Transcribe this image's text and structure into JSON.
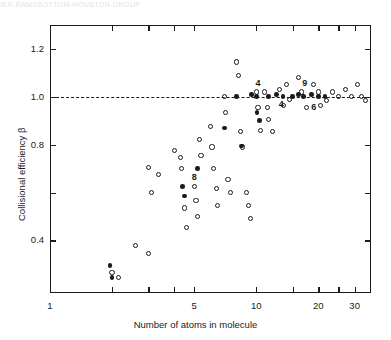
{
  "page_header": "IER-RAMSBOTTOM-HOUSTON-GROUP",
  "figure": {
    "ytitle": "Collisional efficiency β",
    "xtitle": "Number of atoms in molecule",
    "reference_line_value": 1.0
  },
  "chart_data": {
    "type": "scatter",
    "title": "",
    "xlabel": "Number of atoms in molecule",
    "ylabel": "Collisional efficiency β",
    "xscale": "log",
    "xlim": [
      1,
      36
    ],
    "ylim": [
      0.18,
      1.3
    ],
    "yticks": [
      0.4,
      0.6,
      0.8,
      1.0,
      1.2
    ],
    "ytick_labels": [
      "0.4",
      "",
      "0.8",
      "1.0",
      "1.2"
    ],
    "xticks": [
      1,
      2,
      3,
      4,
      5,
      10,
      15,
      20,
      25,
      30
    ],
    "xtick_labels": [
      "1",
      "",
      "",
      "",
      "5",
      "10",
      "",
      "20",
      "",
      "30"
    ],
    "grid": false,
    "legend": null,
    "reference_lines": [
      {
        "orientation": "horizontal",
        "value": 1.0,
        "style": "dashed"
      }
    ],
    "series": [
      {
        "name": "open circles",
        "marker": "open-circle",
        "points": [
          [
            2.0,
            0.265
          ],
          [
            2.15,
            0.245
          ],
          [
            2.6,
            0.38
          ],
          [
            3.0,
            0.345
          ],
          [
            3.1,
            0.6
          ],
          [
            3.0,
            0.705
          ],
          [
            3.35,
            0.675
          ],
          [
            4.0,
            0.775
          ],
          [
            4.3,
            0.745
          ],
          [
            4.35,
            0.7
          ],
          [
            4.5,
            0.535
          ],
          [
            4.6,
            0.455
          ],
          [
            5.0,
            0.625
          ],
          [
            5.1,
            0.565
          ],
          [
            5.2,
            0.5
          ],
          [
            5.3,
            0.82
          ],
          [
            5.4,
            0.755
          ],
          [
            6.0,
            0.875
          ],
          [
            6.1,
            0.79
          ],
          [
            6.2,
            0.7
          ],
          [
            6.4,
            0.615
          ],
          [
            6.5,
            0.545
          ],
          [
            7.0,
            1.0
          ],
          [
            7.1,
            0.935
          ],
          [
            7.3,
            0.655
          ],
          [
            7.5,
            0.6
          ],
          [
            8.0,
            1.145
          ],
          [
            8.2,
            1.09
          ],
          [
            8.4,
            0.855
          ],
          [
            8.6,
            0.79
          ],
          [
            9.0,
            0.6
          ],
          [
            9.2,
            0.545
          ],
          [
            9.4,
            0.49
          ],
          [
            10.0,
            1.02
          ],
          [
            10.2,
            0.955
          ],
          [
            10.5,
            0.86
          ],
          [
            11.0,
            1.02
          ],
          [
            11.3,
            0.955
          ],
          [
            11.5,
            0.905
          ],
          [
            12.0,
            0.855
          ],
          [
            13.0,
            1.03
          ],
          [
            13.5,
            0.965
          ],
          [
            14.0,
            1.05
          ],
          [
            14.5,
            0.99
          ],
          [
            16.0,
            1.08
          ],
          [
            16.5,
            1.02
          ],
          [
            17.5,
            0.955
          ],
          [
            19.0,
            1.05
          ],
          [
            20.0,
            1.02
          ],
          [
            20.5,
            0.965
          ],
          [
            22.0,
            0.985
          ],
          [
            23.5,
            1.02
          ],
          [
            25.0,
            1.0
          ],
          [
            27.0,
            1.03
          ],
          [
            29.0,
            1.0
          ],
          [
            31.0,
            1.05
          ],
          [
            32.5,
            1.0
          ],
          [
            34.0,
            0.985
          ]
        ]
      },
      {
        "name": "filled circles",
        "marker": "filled-circle",
        "points": [
          [
            1.95,
            0.295
          ],
          [
            2.0,
            0.245
          ],
          [
            4.4,
            0.625
          ],
          [
            4.5,
            0.585
          ],
          [
            5.2,
            0.7
          ],
          [
            7.0,
            0.87
          ],
          [
            8.0,
            1.0
          ],
          [
            8.5,
            0.795
          ],
          [
            9.5,
            1.01
          ],
          [
            10.0,
            1.0
          ],
          [
            10.1,
            0.935
          ],
          [
            10.4,
            0.9
          ],
          [
            11.5,
            1.0
          ],
          [
            12.5,
            1.01
          ],
          [
            13.5,
            1.0
          ],
          [
            15.0,
            1.0
          ],
          [
            16.0,
            1.01
          ],
          [
            17.0,
            1.0
          ],
          [
            18.5,
            1.01
          ],
          [
            20.0,
            1.0
          ],
          [
            21.5,
            1.0
          ]
        ]
      }
    ],
    "annotations": [
      {
        "text": "8",
        "x": 5.0,
        "y": 0.66
      },
      {
        "text": "4",
        "x": 10.2,
        "y": 1.055
      },
      {
        "text": "4",
        "x": 13.2,
        "y": 0.965
      },
      {
        "text": "9",
        "x": 17.2,
        "y": 1.055
      },
      {
        "text": "6",
        "x": 19.0,
        "y": 0.955
      }
    ]
  }
}
